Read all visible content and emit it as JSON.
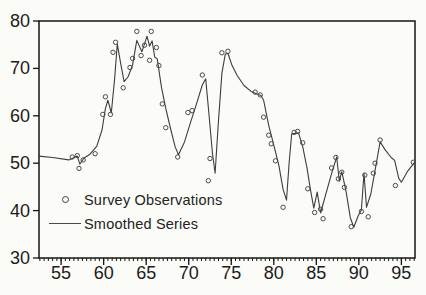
{
  "chart_data": {
    "type": "line",
    "title": "",
    "xlabel": "",
    "ylabel": "",
    "xlim": [
      52.4,
      96.6
    ],
    "ylim": [
      30,
      80
    ],
    "grid": false,
    "x_ticks_labeled": [
      55,
      60,
      65,
      70,
      75,
      80,
      85,
      90,
      95
    ],
    "x_minor_tick_step": 0.5,
    "y_ticks_labeled": [
      30,
      40,
      50,
      60,
      70,
      80
    ],
    "legend": {
      "position": "inside-lower-left"
    },
    "series": [
      {
        "name": "Survey Observations",
        "kind": "scatter",
        "marker": "open-circle",
        "points": [
          [
            56.3,
            51.3
          ],
          [
            56.9,
            51.6
          ],
          [
            57.1,
            48.9
          ],
          [
            57.6,
            50.7
          ],
          [
            59.0,
            52.0
          ],
          [
            59.9,
            60.3
          ],
          [
            60.2,
            64.0
          ],
          [
            60.8,
            60.3
          ],
          [
            61.1,
            73.4
          ],
          [
            61.4,
            75.5
          ],
          [
            62.3,
            65.9
          ],
          [
            63.1,
            70.2
          ],
          [
            63.4,
            72.1
          ],
          [
            63.9,
            77.8
          ],
          [
            64.4,
            72.7
          ],
          [
            64.8,
            74.9
          ],
          [
            65.4,
            71.7
          ],
          [
            65.6,
            77.8
          ],
          [
            66.2,
            74.4
          ],
          [
            66.5,
            70.6
          ],
          [
            66.9,
            62.5
          ],
          [
            67.3,
            57.5
          ],
          [
            68.7,
            51.3
          ],
          [
            69.9,
            60.7
          ],
          [
            70.4,
            61.1
          ],
          [
            71.6,
            68.6
          ],
          [
            72.3,
            46.3
          ],
          [
            72.5,
            51.0
          ],
          [
            73.9,
            73.3
          ],
          [
            74.6,
            73.6
          ],
          [
            77.8,
            65.0
          ],
          [
            78.4,
            64.4
          ],
          [
            78.8,
            59.7
          ],
          [
            79.4,
            55.9
          ],
          [
            79.7,
            54.1
          ],
          [
            80.2,
            50.5
          ],
          [
            81.1,
            40.7
          ],
          [
            82.4,
            56.5
          ],
          [
            82.8,
            56.7
          ],
          [
            83.4,
            54.3
          ],
          [
            84.0,
            44.6
          ],
          [
            84.8,
            39.6
          ],
          [
            85.5,
            40.3
          ],
          [
            85.8,
            38.3
          ],
          [
            86.8,
            49.0
          ],
          [
            87.3,
            51.2
          ],
          [
            87.6,
            46.7
          ],
          [
            88.0,
            48.1
          ],
          [
            88.3,
            44.9
          ],
          [
            89.1,
            36.6
          ],
          [
            90.3,
            39.8
          ],
          [
            90.7,
            47.5
          ],
          [
            91.1,
            38.7
          ],
          [
            91.7,
            47.9
          ],
          [
            91.9,
            50.0
          ],
          [
            92.5,
            54.9
          ],
          [
            94.3,
            45.3
          ],
          [
            96.4,
            50.2
          ]
        ]
      },
      {
        "name": "Smoothed Series",
        "kind": "line",
        "points": [
          [
            52.4,
            51.5
          ],
          [
            54.0,
            51.2
          ],
          [
            55.9,
            50.7
          ],
          [
            56.9,
            51.5
          ],
          [
            57.2,
            49.8
          ],
          [
            57.7,
            51.1
          ],
          [
            58.4,
            51.9
          ],
          [
            59.2,
            53.6
          ],
          [
            59.8,
            57.0
          ],
          [
            60.2,
            61.5
          ],
          [
            60.5,
            63.3
          ],
          [
            60.9,
            60.6
          ],
          [
            61.3,
            68.0
          ],
          [
            61.6,
            75.2
          ],
          [
            62.0,
            71.0
          ],
          [
            62.4,
            67.2
          ],
          [
            62.9,
            68.3
          ],
          [
            63.4,
            70.8
          ],
          [
            63.9,
            75.9
          ],
          [
            64.5,
            73.5
          ],
          [
            65.1,
            76.8
          ],
          [
            65.4,
            74.7
          ],
          [
            65.7,
            75.8
          ],
          [
            66.0,
            72.4
          ],
          [
            66.3,
            72.0
          ],
          [
            66.8,
            66.0
          ],
          [
            67.3,
            61.5
          ],
          [
            67.9,
            57.0
          ],
          [
            68.4,
            53.5
          ],
          [
            68.8,
            51.8
          ],
          [
            69.5,
            54.5
          ],
          [
            70.2,
            58.5
          ],
          [
            71.0,
            63.0
          ],
          [
            71.6,
            66.5
          ],
          [
            72.0,
            67.8
          ],
          [
            72.4,
            60.0
          ],
          [
            72.8,
            52.0
          ],
          [
            73.1,
            47.9
          ],
          [
            73.5,
            59.0
          ],
          [
            73.9,
            69.0
          ],
          [
            74.3,
            73.0
          ],
          [
            74.6,
            73.2
          ],
          [
            75.1,
            70.6
          ],
          [
            75.7,
            68.5
          ],
          [
            76.5,
            66.4
          ],
          [
            77.3,
            65.2
          ],
          [
            78.0,
            64.6
          ],
          [
            78.5,
            64.3
          ],
          [
            78.8,
            63.3
          ],
          [
            79.4,
            58.0
          ],
          [
            80.0,
            53.8
          ],
          [
            80.6,
            49.5
          ],
          [
            81.1,
            44.5
          ],
          [
            81.5,
            42.2
          ],
          [
            81.8,
            50.0
          ],
          [
            82.1,
            56.2
          ],
          [
            82.9,
            56.4
          ],
          [
            83.4,
            53.5
          ],
          [
            83.9,
            49.0
          ],
          [
            84.3,
            44.5
          ],
          [
            84.7,
            40.5
          ],
          [
            85.1,
            43.9
          ],
          [
            85.5,
            39.5
          ],
          [
            86.2,
            44.0
          ],
          [
            86.9,
            48.5
          ],
          [
            87.4,
            51.3
          ],
          [
            87.7,
            46.2
          ],
          [
            88.0,
            48.2
          ],
          [
            88.5,
            44.0
          ],
          [
            89.0,
            38.5
          ],
          [
            89.4,
            36.5
          ],
          [
            89.9,
            38.8
          ],
          [
            90.3,
            40.2
          ],
          [
            90.6,
            47.9
          ],
          [
            90.9,
            40.7
          ],
          [
            91.4,
            43.5
          ],
          [
            91.8,
            47.5
          ],
          [
            92.2,
            51.5
          ],
          [
            92.5,
            54.5
          ],
          [
            93.1,
            52.8
          ],
          [
            93.8,
            51.2
          ],
          [
            94.2,
            50.6
          ],
          [
            94.7,
            46.8
          ],
          [
            95.0,
            46.0
          ],
          [
            95.7,
            48.2
          ],
          [
            96.6,
            50.3
          ]
        ]
      }
    ],
    "colors": {
      "line": "#3d3d3d",
      "marker_outline": "#4a4a4a",
      "axis": "#161616",
      "text": "#1c1c1c",
      "background": "#fbfbf8"
    }
  }
}
